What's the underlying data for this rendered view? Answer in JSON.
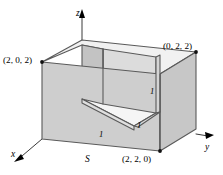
{
  "figure": {
    "title_label": "S",
    "background_color": "#ffffff",
    "stroke_color": "#4a4a4a",
    "axes": [
      {
        "name": "z",
        "label": "z",
        "direction": "up"
      },
      {
        "name": "y",
        "label": "y",
        "direction": "right"
      },
      {
        "name": "x",
        "label": "x",
        "direction": "down-left"
      }
    ],
    "vertex_labels": [
      {
        "name": "vertex-label-202",
        "text": "(2, 0, 2)"
      },
      {
        "name": "vertex-label-022",
        "text": "(0, 2, 2)"
      },
      {
        "name": "vertex-label-220",
        "text": "(2, 2, 0)"
      }
    ],
    "dimension_labels": [
      {
        "name": "dim-front-left",
        "text": "1"
      },
      {
        "name": "dim-front-right",
        "text": "1"
      },
      {
        "name": "dim-right-vertical",
        "text": "1"
      }
    ],
    "face_colors": {
      "top": "#efefef",
      "left": "#cfcfcf",
      "front_right": "#c8c8c8",
      "notch_back": "#d8d8d8",
      "notch_side": "#c4c4c4",
      "notch_floor": "#f4f4f4",
      "notch_ledge": "#e2e2e2"
    }
  }
}
